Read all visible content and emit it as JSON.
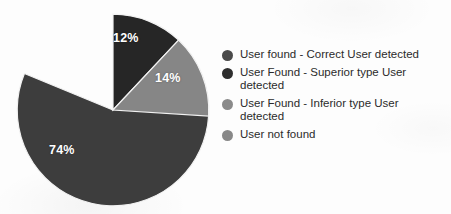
{
  "chart_data": {
    "type": "pie",
    "title": "",
    "subtitle": "",
    "xlabel": "",
    "ylabel": "",
    "grid": false,
    "legend_position": "right",
    "start_angle_deg": 0,
    "direction": "clockwise",
    "categories": [
      "User found - Correct User detected",
      "User Found - Superior type User detected",
      "User Found - Inferior type User detected",
      "User not found"
    ],
    "values": [
      74,
      12,
      14,
      0
    ],
    "value_unit": "%",
    "data_labels": [
      "74%",
      "12%",
      "14%",
      ""
    ],
    "colors": [
      "#3d3d3d",
      "#262626",
      "#868686",
      "#888888"
    ],
    "slices": [
      {
        "name": "User found - Correct User detected",
        "value": 74,
        "label": "74%",
        "color": "#3d3d3d",
        "legend_color": "#4a4a4a",
        "start_deg": 26,
        "sweep_deg": 266.4
      },
      {
        "name": "User Found - Superior type User detected",
        "value": 12,
        "label": "12%",
        "color": "#262626",
        "legend_color": "#2e2e2e",
        "start_deg": 0,
        "sweep_deg": 43.2
      },
      {
        "name": "User Found - Inferior type User detected",
        "value": 14,
        "label": "14%",
        "color": "#868686",
        "legend_color": "#8a8a8a",
        "start_deg": 43.2,
        "sweep_deg": 50.4
      },
      {
        "name": "User not found",
        "value": 0,
        "label": "",
        "color": "#888888",
        "legend_color": "#888888",
        "start_deg": 0,
        "sweep_deg": 0
      }
    ]
  },
  "pie": {
    "labels": {
      "superior": "12%",
      "inferior": "14%",
      "correct": "74%"
    }
  },
  "legend": {
    "items": [
      {
        "label": "User found - Correct User detected",
        "color": "#4a4a4a"
      },
      {
        "label": "User Found - Superior type User detected",
        "color": "#2e2e2e"
      },
      {
        "label": "User Found - Inferior type User detected",
        "color": "#8a8a8a"
      },
      {
        "label": "User not found",
        "color": "#888888"
      }
    ]
  }
}
